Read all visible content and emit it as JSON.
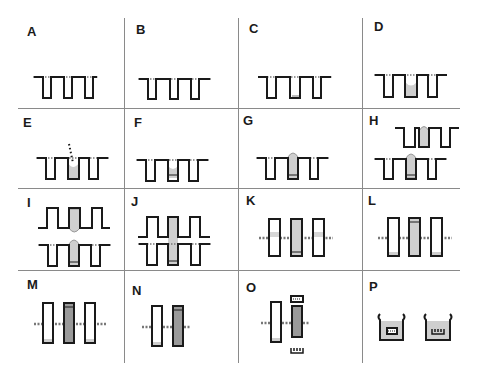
{
  "figure": {
    "type": "multi-panel process diagram",
    "rows": 4,
    "cols": 4,
    "colors": {
      "line": "#1a1a1a",
      "fill_light": "#cfcfcf",
      "fill_dark": "#9a9a9a",
      "grid": "#8a8a8a",
      "background": "#ffffff"
    },
    "panels": [
      {
        "label": "A",
        "row": 0,
        "col": 0,
        "description": "three open wells, surface dotted"
      },
      {
        "label": "B",
        "row": 0,
        "col": 1,
        "description": "three open wells"
      },
      {
        "label": "C",
        "row": 0,
        "col": 2,
        "description": "middle well with thin bottom layer"
      },
      {
        "label": "D",
        "row": 0,
        "col": 3,
        "description": "middle well partially filled"
      },
      {
        "label": "E",
        "row": 1,
        "col": 0,
        "description": "dotted dispense path into middle well"
      },
      {
        "label": "F",
        "row": 1,
        "col": 1,
        "description": "middle well filled with layer at bottom"
      },
      {
        "label": "G",
        "row": 1,
        "col": 2,
        "description": "domed fill protruding from middle well"
      },
      {
        "label": "H",
        "row": 1,
        "col": 3,
        "description": "second inverted wafer above, both domed"
      },
      {
        "label": "I",
        "row": 2,
        "col": 0,
        "description": "upper wafer approaching lower wafer"
      },
      {
        "label": "J",
        "row": 2,
        "col": 1,
        "description": "wafers joined, fill bridging"
      },
      {
        "label": "K",
        "row": 2,
        "col": 2,
        "description": "bonded stack with filled center cavity"
      },
      {
        "label": "L",
        "row": 2,
        "col": 3,
        "description": "bonded stack, side cavities with bottom layer"
      },
      {
        "label": "M",
        "row": 3,
        "col": 0,
        "description": "center cavity dark filled"
      },
      {
        "label": "N",
        "row": 3,
        "col": 1,
        "description": "two cavities, right dark filled"
      },
      {
        "label": "O",
        "row": 3,
        "col": 2,
        "description": "caps removed from dark cavity"
      },
      {
        "label": "P",
        "row": 3,
        "col": 3,
        "description": "two beakers with released parts"
      }
    ]
  }
}
